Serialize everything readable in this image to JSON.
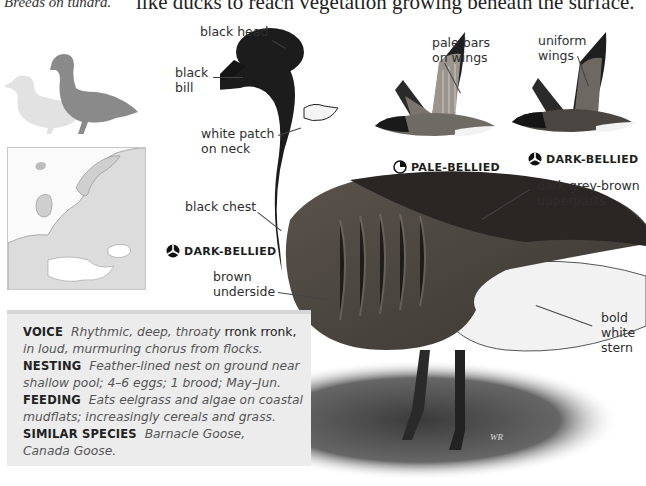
{
  "page": {
    "caption_fragment": "Breeds on tundra.",
    "body_fragment": "like ducks to reach vegetation growing beneath the surface."
  },
  "figure": {
    "silhouette_alt": "size comparison silhouette (goose vs mallard)",
    "map_alt": "range map of Europe",
    "labels": {
      "black_head": "black head",
      "black_bill_line1": "black",
      "black_bill_line2": "bill",
      "white_patch_line1": "white patch",
      "white_patch_line2": "on neck",
      "black_chest": "black chest",
      "brown_underside_line1": "brown",
      "brown_underside_line2": "underside",
      "pale_bars_line1": "pale bars",
      "pale_bars_line2": "on wings",
      "uniform_wings_line1": "uniform",
      "uniform_wings_line2": "wings",
      "upperparts_line1": "dark grey-brown",
      "upperparts_line2": "upperparts",
      "stern_line1": "bold",
      "stern_line2": "white",
      "stern_line3": "stern"
    },
    "variants": {
      "pale_bellied": "PALE-BELLIED",
      "dark_bellied_flight": "DARK-BELLIED",
      "dark_bellied_main": "DARK-BELLIED"
    }
  },
  "info": {
    "voice": {
      "key": "VOICE",
      "text_1a": "Rhythmic, deep, throaty",
      "text_1b": "rronk rronk,",
      "text_2": "in loud, murmuring chorus from flocks."
    },
    "nesting": {
      "key": "NESTING",
      "text_1": "Feather-lined nest on ground near",
      "text_2": "shallow pool; 4–6 eggs; 1 brood; May–Jun."
    },
    "feeding": {
      "key": "FEEDING",
      "text_1": "Eats eelgrass and algae on coastal",
      "text_2": "mudflats; increasingly cereals and grass."
    },
    "similar": {
      "key": "SIMILAR SPECIES",
      "text_1": "Barnacle Goose,",
      "text_2": "Canada Goose."
    }
  },
  "colors": {
    "info_box_bg": "#ececec",
    "goose_black": "#1c1c1c",
    "goose_brown": "#4a4540",
    "stern_white": "#f4f4f4",
    "silhouette_goose": "#8a8a8a",
    "silhouette_duck": "#e2e2e2"
  }
}
